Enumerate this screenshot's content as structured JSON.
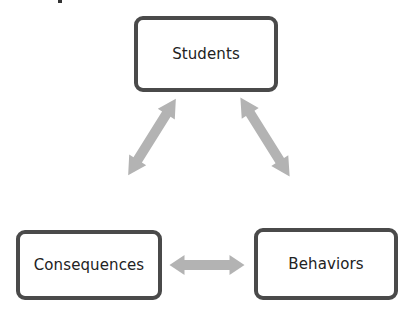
{
  "diagram": {
    "nodes": [
      {
        "id": "students",
        "label": "Students"
      },
      {
        "id": "consequences",
        "label": "Consequences"
      },
      {
        "id": "behaviors",
        "label": "Behaviors"
      }
    ],
    "edges": [
      {
        "from": "students",
        "to": "consequences",
        "type": "bidirectional"
      },
      {
        "from": "students",
        "to": "behaviors",
        "type": "bidirectional"
      },
      {
        "from": "consequences",
        "to": "behaviors",
        "type": "bidirectional"
      }
    ],
    "colors": {
      "box_border": "#4a4a4a",
      "arrow": "#b3b3b3",
      "text": "#222222"
    }
  }
}
